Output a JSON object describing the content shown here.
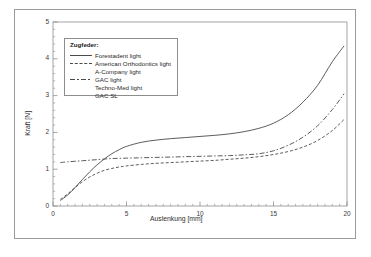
{
  "chart_data": {
    "type": "line",
    "title": "",
    "xlabel": "Auslenkung [mm]",
    "ylabel": "Kraft [N]",
    "xlim": [
      0,
      20
    ],
    "ylim": [
      0,
      5
    ],
    "xticks": [
      "0",
      "5",
      "10",
      "15",
      "20"
    ],
    "yticks": [
      "0",
      "1",
      "2",
      "3",
      "4",
      "5"
    ],
    "xtick_values": [
      0,
      5,
      10,
      15,
      20
    ],
    "ytick_values": [
      0,
      1,
      2,
      3,
      4,
      5
    ],
    "minor_ticks": true,
    "grid": false,
    "legend_position": "upper-left-inside",
    "legend_title": "Zugfeder:",
    "series": [
      {
        "name": "Forestadent light",
        "style": "solid",
        "color": "#4a4a4a",
        "x": [
          0.5,
          1,
          1.5,
          2,
          2.5,
          3,
          3.5,
          4,
          4.5,
          5,
          6,
          7,
          8,
          9,
          10,
          11,
          12,
          13,
          14,
          15,
          16,
          17,
          18,
          19,
          19.8
        ],
        "y": [
          0.15,
          0.3,
          0.5,
          0.72,
          0.93,
          1.12,
          1.28,
          1.42,
          1.53,
          1.62,
          1.73,
          1.79,
          1.83,
          1.86,
          1.89,
          1.92,
          1.96,
          2.02,
          2.11,
          2.25,
          2.48,
          2.82,
          3.28,
          3.92,
          4.35
        ]
      },
      {
        "name": "American Orthodontics light",
        "style": "dashed",
        "color": "#4a4a4a",
        "x": [
          0.5,
          1,
          1.5,
          2,
          2.5,
          3,
          3.5,
          4,
          4.5,
          5,
          6,
          7,
          8,
          9,
          10,
          11,
          12,
          13,
          14,
          15,
          16,
          17,
          18,
          19,
          19.8
        ],
        "y": [
          0.18,
          0.33,
          0.5,
          0.66,
          0.79,
          0.89,
          0.97,
          1.02,
          1.06,
          1.09,
          1.13,
          1.16,
          1.18,
          1.2,
          1.22,
          1.24,
          1.27,
          1.3,
          1.34,
          1.4,
          1.48,
          1.6,
          1.78,
          2.05,
          2.35
        ]
      },
      {
        "name": "A-Company light",
        "style": "none",
        "color": "#4a4a4a",
        "x": [],
        "y": []
      },
      {
        "name": "GAC light",
        "style": "dashdot",
        "color": "#4a4a4a",
        "x": [
          0.5,
          1,
          2,
          3,
          4,
          5,
          6,
          7,
          8,
          9,
          10,
          11,
          12,
          13,
          14,
          15,
          16,
          17,
          18,
          19,
          19.8
        ],
        "y": [
          1.18,
          1.2,
          1.23,
          1.26,
          1.29,
          1.3,
          1.31,
          1.32,
          1.33,
          1.34,
          1.35,
          1.36,
          1.37,
          1.39,
          1.42,
          1.5,
          1.65,
          1.87,
          2.18,
          2.62,
          3.05
        ]
      },
      {
        "name": "Techno-Med light",
        "style": "none",
        "color": "#4a4a4a",
        "x": [],
        "y": []
      },
      {
        "name": "GAC SL",
        "style": "none",
        "color": "#4a4a4a",
        "x": [],
        "y": []
      }
    ]
  },
  "figure": {
    "axis_color": "#8d8d8d",
    "text_color": "#2a2a2a",
    "background": "#ffffff",
    "frame_color": "#9a9a9a"
  }
}
